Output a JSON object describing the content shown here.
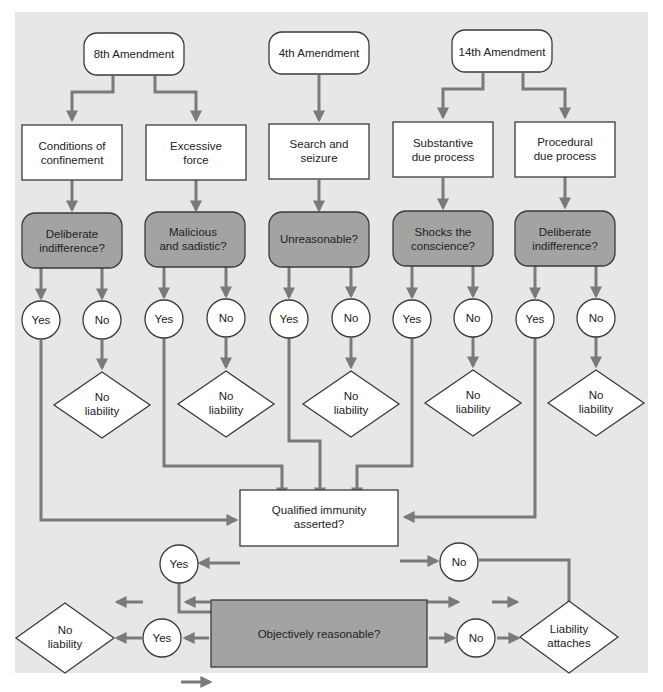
{
  "amendments": [
    {
      "label": "8th Amendment"
    },
    {
      "label": "4th Amendment"
    },
    {
      "label": "14th Amendment"
    }
  ],
  "claims": [
    {
      "line1": "Conditions of",
      "line2": "confinement"
    },
    {
      "line1": "Excessive",
      "line2": "force"
    },
    {
      "line1": "Search and",
      "line2": "seizure"
    },
    {
      "line1": "Substantive",
      "line2": "due process"
    },
    {
      "line1": "Procedural",
      "line2": "due process"
    }
  ],
  "standards": [
    {
      "line1": "Deliberate",
      "line2": "indifference?"
    },
    {
      "line1": "Malicious",
      "line2": "and sadistic?"
    },
    {
      "line1": "Unreasonable?",
      "line2": ""
    },
    {
      "line1": "Shocks the",
      "line2": "conscience?"
    },
    {
      "line1": "Deliberate",
      "line2": "indifference?"
    }
  ],
  "answers": {
    "yes": "Yes",
    "no": "No"
  },
  "no_liability": {
    "line1": "No",
    "line2": "liability"
  },
  "qualified_immunity": {
    "line1": "Qualified immunity",
    "line2": "asserted?"
  },
  "objectively_reasonable": {
    "label": "Objectively reasonable?"
  },
  "liability_attaches": {
    "line1": "Liability",
    "line2": "attaches"
  },
  "colors": {
    "background": "#e7e7e6",
    "question_fill": "#a3a3a2",
    "arrow": "#7a7a7a",
    "stroke": "#3a3a3a"
  }
}
